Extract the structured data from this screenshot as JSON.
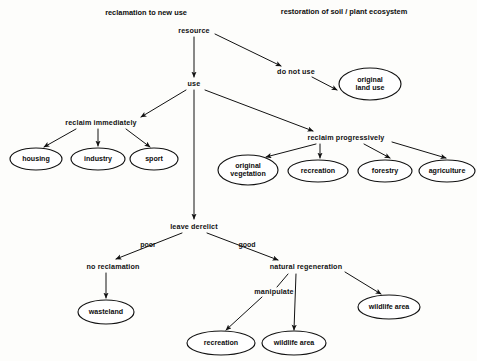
{
  "diagram": {
    "headers": [
      {
        "id": "header-left",
        "text": "reclamation to new use",
        "x": 146,
        "y": 12
      },
      {
        "id": "header-right",
        "text": "restoration of soil / plant ecosystem",
        "x": 344,
        "y": 11
      }
    ],
    "text_nodes": [
      {
        "id": "resource",
        "text": "resource",
        "x": 194,
        "y": 31
      },
      {
        "id": "do-not-use",
        "text": "do not use",
        "x": 296,
        "y": 72
      },
      {
        "id": "use",
        "text": "use",
        "x": 194,
        "y": 84
      },
      {
        "id": "reclaim-immediately",
        "text": "reclaim immediately",
        "x": 101,
        "y": 123
      },
      {
        "id": "reclaim-progressively",
        "text": "reclaim progressively",
        "x": 346,
        "y": 138
      },
      {
        "id": "leave-derelict",
        "text": "leave derelict",
        "x": 194,
        "y": 227
      },
      {
        "id": "no-reclamation",
        "text": "no reclamation",
        "x": 113,
        "y": 267
      },
      {
        "id": "natural-regeneration",
        "text": "natural regeneration",
        "x": 306,
        "y": 267
      },
      {
        "id": "manipulate",
        "text": "manipulate",
        "x": 274,
        "y": 292
      }
    ],
    "edge_labels": [
      {
        "id": "edge-poor",
        "text": "poor",
        "x": 148,
        "y": 244
      },
      {
        "id": "edge-good",
        "text": "good",
        "x": 247,
        "y": 244
      }
    ],
    "ellipses": [
      {
        "id": "original-land-use",
        "lines": [
          "original",
          "land use"
        ],
        "cx": 370,
        "cy": 84,
        "rx": 31,
        "ry": 16
      },
      {
        "id": "housing",
        "lines": [
          "housing"
        ],
        "cx": 36,
        "cy": 159,
        "rx": 26,
        "ry": 11
      },
      {
        "id": "industry",
        "lines": [
          "industry"
        ],
        "cx": 98,
        "cy": 159,
        "rx": 27,
        "ry": 11
      },
      {
        "id": "sport",
        "lines": [
          "sport"
        ],
        "cx": 154,
        "cy": 159,
        "rx": 24,
        "ry": 11
      },
      {
        "id": "original-vegetation",
        "lines": [
          "original",
          "vegetation"
        ],
        "cx": 248,
        "cy": 170,
        "rx": 30,
        "ry": 15
      },
      {
        "id": "recreation-progressive",
        "lines": [
          "recreation"
        ],
        "cx": 318,
        "cy": 171,
        "rx": 30,
        "ry": 11
      },
      {
        "id": "forestry",
        "lines": [
          "forestry"
        ],
        "cx": 385,
        "cy": 171,
        "rx": 27,
        "ry": 11
      },
      {
        "id": "agriculture",
        "lines": [
          "agriculture"
        ],
        "cx": 447,
        "cy": 171,
        "rx": 28,
        "ry": 11
      },
      {
        "id": "wasteland",
        "lines": [
          "wasteland"
        ],
        "cx": 106,
        "cy": 312,
        "rx": 28,
        "ry": 12
      },
      {
        "id": "wildlife-area-right",
        "lines": [
          "wildlife area"
        ],
        "cx": 389,
        "cy": 307,
        "rx": 31,
        "ry": 12
      },
      {
        "id": "recreation-manipulate",
        "lines": [
          "recreation"
        ],
        "cx": 221,
        "cy": 343,
        "rx": 34,
        "ry": 12
      },
      {
        "id": "wildlife-area-center",
        "lines": [
          "wildlife area"
        ],
        "cx": 294,
        "cy": 343,
        "rx": 32,
        "ry": 12
      }
    ],
    "edges": [
      {
        "id": "resource-to-use",
        "from": "resource",
        "to": "use",
        "path": "M 194 37 L 194 77",
        "arrow": true
      },
      {
        "id": "resource-to-do-not-use",
        "from": "resource",
        "to": "do-not-use",
        "path": "M 215 34 L 281 66",
        "arrow": true
      },
      {
        "id": "do-not-use-to-original-land-use",
        "from": "do-not-use",
        "to": "original-land-use",
        "path": "M 312 77 L 337 90",
        "arrow": true
      },
      {
        "id": "use-to-reclaim-immediately",
        "from": "use",
        "to": "reclaim-immediately",
        "path": "M 186 90 L 141 117",
        "arrow": true
      },
      {
        "id": "use-to-leave-derelict",
        "from": "use",
        "to": "leave-derelict",
        "path": "M 194 90 L 194 219",
        "arrow": true
      },
      {
        "id": "use-to-reclaim-progressively",
        "from": "use",
        "to": "reclaim-progressively",
        "path": "M 205 90 L 313 131",
        "arrow": true
      },
      {
        "id": "reclaim-immediately-to-housing",
        "from": "reclaim-immediately",
        "to": "housing",
        "path": "M 76 129 L 44 147",
        "arrow": true
      },
      {
        "id": "reclaim-immediately-to-industry",
        "from": "reclaim-immediately",
        "to": "industry",
        "path": "M 98 129 L 98 146",
        "arrow": true
      },
      {
        "id": "reclaim-immediately-to-sport",
        "from": "reclaim-immediately",
        "to": "sport",
        "path": "M 126 129 L 150 147",
        "arrow": true
      },
      {
        "id": "reclaim-progressively-to-original-vegetation",
        "from": "reclaim-progressively",
        "to": "original-vegetation",
        "path": "M 316 144 L 266 157",
        "arrow": true
      },
      {
        "id": "reclaim-progressively-to-recreation",
        "from": "reclaim-progressively",
        "to": "recreation-progressive",
        "path": "M 320 144 L 320 158",
        "arrow": true
      },
      {
        "id": "reclaim-progressively-to-forestry",
        "from": "reclaim-progressively",
        "to": "forestry",
        "path": "M 364 144 L 390 158",
        "arrow": true
      },
      {
        "id": "reclaim-progressively-to-agriculture",
        "from": "reclaim-progressively",
        "to": "agriculture",
        "path": "M 392 142 L 446 158",
        "arrow": true
      },
      {
        "id": "leave-derelict-to-no-reclamation",
        "from": "leave-derelict",
        "to": "no-reclamation",
        "path": "M 182 233 L 116 259",
        "arrow": true
      },
      {
        "id": "leave-derelict-to-natural-regeneration",
        "from": "leave-derelict",
        "to": "natural-regeneration",
        "path": "M 207 233 L 278 260",
        "arrow": true
      },
      {
        "id": "no-reclamation-to-wasteland",
        "from": "no-reclamation",
        "to": "wasteland",
        "path": "M 106 273 L 106 298",
        "arrow": true
      },
      {
        "id": "natural-regeneration-to-manipulate",
        "from": "natural-regeneration",
        "to": "manipulate",
        "path": "M 288 274 L 277 287",
        "arrow": false
      },
      {
        "id": "natural-regeneration-to-wildlife-area-center",
        "from": "natural-regeneration",
        "to": "wildlife-area-center",
        "path": "M 296 274 L 294 330",
        "arrow": true
      },
      {
        "id": "natural-regeneration-to-wildlife-area-right",
        "from": "natural-regeneration",
        "to": "wildlife-area-right",
        "path": "M 345 272 L 381 294",
        "arrow": true
      },
      {
        "id": "manipulate-to-recreation",
        "from": "manipulate",
        "to": "recreation-manipulate",
        "path": "M 262 297 L 226 330",
        "arrow": true
      }
    ],
    "style": {
      "stroke_color": "#121212",
      "ellipse_fill": "#ffffff",
      "background": "#fdfdfb",
      "stroke_width": 1
    }
  }
}
